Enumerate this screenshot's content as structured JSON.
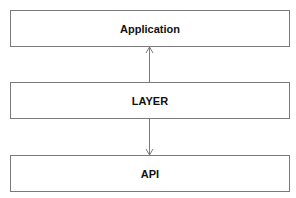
{
  "diagram": {
    "type": "layered-architecture",
    "boxes": [
      {
        "id": "application",
        "label": "Application"
      },
      {
        "id": "layer",
        "label": "LAYER"
      },
      {
        "id": "api",
        "label": "API"
      }
    ],
    "edges": [
      {
        "from": "layer",
        "to": "application",
        "style": "open-arrow"
      },
      {
        "from": "layer",
        "to": "api",
        "style": "open-arrow"
      }
    ],
    "colors": {
      "border": "#7a7a7a",
      "text": "#111111",
      "background": "#ffffff"
    }
  }
}
